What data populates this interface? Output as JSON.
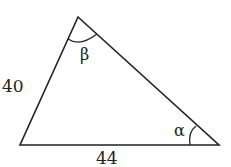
{
  "diagram": {
    "type": "triangle",
    "vertices": {
      "top": [
        78,
        17
      ],
      "bottom_left": [
        20,
        145
      ],
      "bottom_right": [
        219,
        145
      ]
    },
    "sides": {
      "left": "40",
      "bottom": "44"
    },
    "angles": {
      "top": "β",
      "bottom_right": "α"
    },
    "stroke_color": "#222222"
  }
}
